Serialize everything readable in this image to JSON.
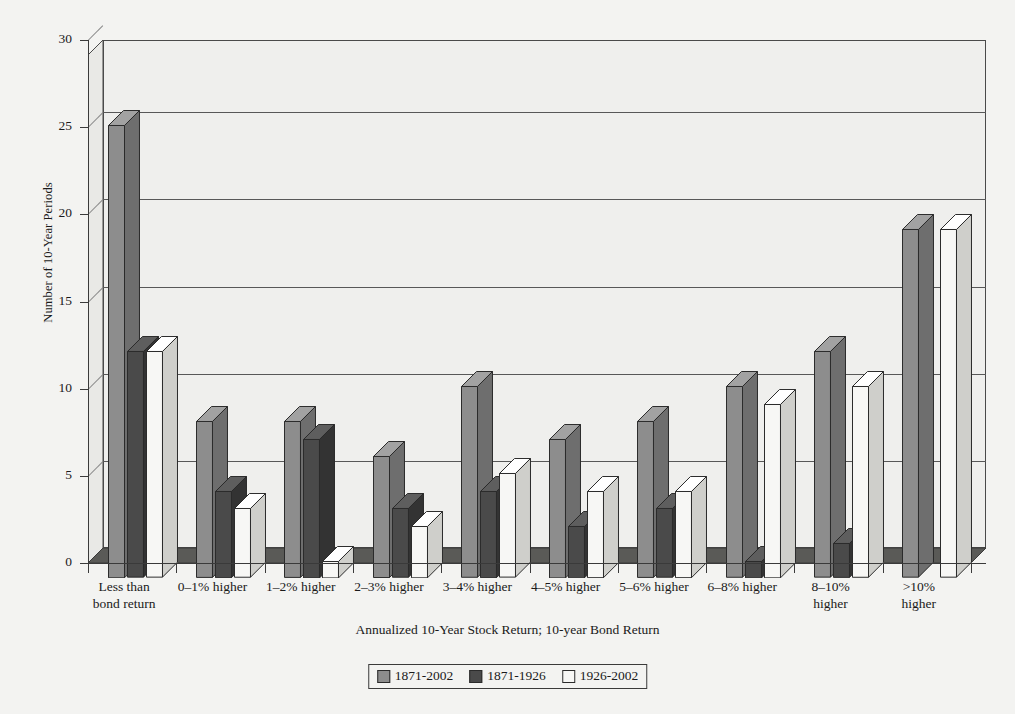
{
  "chart_data": {
    "type": "bar",
    "title": "",
    "xlabel": "Annualized 10-Year Stock Return; 10-year Bond Return",
    "ylabel": "Number of 10-Year Periods",
    "ylim": [
      0,
      30
    ],
    "ytick_labels": [
      "0",
      "5",
      "10",
      "15",
      "20",
      "25",
      "30"
    ],
    "ytick_values": [
      0,
      5,
      10,
      15,
      20,
      25,
      30
    ],
    "grid": true,
    "legend_position": "bottom",
    "categories": [
      "Less than bond return",
      "0–1% higher",
      "1–2% higher",
      "2–3% higher",
      "3–4% higher",
      "4–5% higher",
      "5–6% higher",
      "6–8% higher",
      "8–10% higher",
      ">10% higher"
    ],
    "category_lines": [
      [
        "Less than",
        "bond return"
      ],
      [
        "0–1% higher"
      ],
      [
        "1–2% higher"
      ],
      [
        "2–3% higher"
      ],
      [
        "3–4% higher"
      ],
      [
        "4–5% higher"
      ],
      [
        "5–6% higher"
      ],
      [
        "6–8% higher"
      ],
      [
        "8–10%",
        "higher"
      ],
      [
        ">10%",
        "higher"
      ]
    ],
    "series": [
      {
        "name": "1871-2002",
        "color": "#8d8d8d",
        "side_color": "#6e6e6e",
        "top_color": "#a2a2a2",
        "values": [
          26,
          9,
          9,
          7,
          11,
          8,
          9,
          11,
          13,
          20
        ]
      },
      {
        "name": "1871-1926",
        "color": "#4a4a4a",
        "side_color": "#333333",
        "top_color": "#5e5e5e",
        "values": [
          13,
          5,
          8,
          4,
          5,
          3,
          4,
          1,
          2,
          0
        ]
      },
      {
        "name": "1926-2002",
        "color": "#f7f7f5",
        "side_color": "#cfcfcb",
        "top_color": "#ffffff",
        "values": [
          13,
          4,
          1,
          3,
          6,
          5,
          5,
          10,
          11,
          20
        ]
      }
    ]
  },
  "legend": {
    "items": [
      {
        "label": "1871-2002"
      },
      {
        "label": "1871-1926"
      },
      {
        "label": "1926-2002"
      }
    ]
  }
}
